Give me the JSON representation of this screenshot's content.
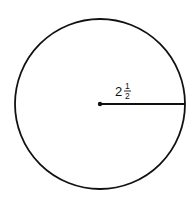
{
  "diagram": {
    "type": "circle-with-radius",
    "center": {
      "x": 100,
      "y": 104
    },
    "radius_px": 85,
    "stroke_color": "#111111",
    "background": "#ffffff",
    "radius_label": {
      "whole": "2",
      "numerator": "1",
      "denominator": "2",
      "text": "2 1/2"
    }
  }
}
